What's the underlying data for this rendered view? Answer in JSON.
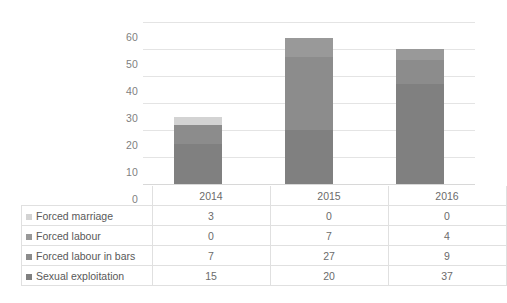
{
  "chart_data": {
    "type": "bar",
    "subtype": "stacked-column-with-data-table",
    "title": "",
    "xlabel": "",
    "ylabel": "",
    "categories": [
      "2014",
      "2015",
      "2016"
    ],
    "series": [
      {
        "name": "Sexual exploitation",
        "values": [
          15,
          20,
          37
        ],
        "color": "#808080"
      },
      {
        "name": "Forced labour in bars",
        "values": [
          7,
          27,
          9
        ],
        "color": "#8c8c8c"
      },
      {
        "name": "Forced labour",
        "values": [
          0,
          7,
          4
        ],
        "color": "#999999"
      },
      {
        "name": "Forced marriage",
        "values": [
          3,
          0,
          0
        ],
        "color": "#d3d3d3"
      }
    ],
    "totals": [
      25,
      54,
      50
    ],
    "ylim": [
      0,
      60
    ],
    "ytick_step": 10,
    "yticks": [
      "60",
      "50",
      "40",
      "30",
      "20",
      "10",
      "0"
    ],
    "grid": true,
    "legend_position": "data-table-left-column"
  },
  "table": {
    "header": {
      "blank_label": "",
      "years": [
        "2014",
        "2015",
        "2016"
      ]
    },
    "rows": [
      {
        "label": "Forced marriage",
        "swatch": "#d3d3d3",
        "values": [
          "3",
          "0",
          "0"
        ]
      },
      {
        "label": "Forced labour",
        "swatch": "#999999",
        "values": [
          "0",
          "7",
          "4"
        ]
      },
      {
        "label": "Forced labour in bars",
        "swatch": "#8c8c8c",
        "values": [
          "7",
          "27",
          "9"
        ]
      },
      {
        "label": "Sexual exploitation",
        "swatch": "#808080",
        "values": [
          "15",
          "20",
          "37"
        ]
      }
    ]
  },
  "axis": {
    "y_ticks": [
      "60",
      "50",
      "40",
      "30",
      "20",
      "10",
      "0"
    ]
  },
  "colors": {
    "plot_background": "#ffffff",
    "gridline": "#e4e4e4",
    "axis_text": "#7f7f7f",
    "table_border": "#e0e0e0"
  }
}
